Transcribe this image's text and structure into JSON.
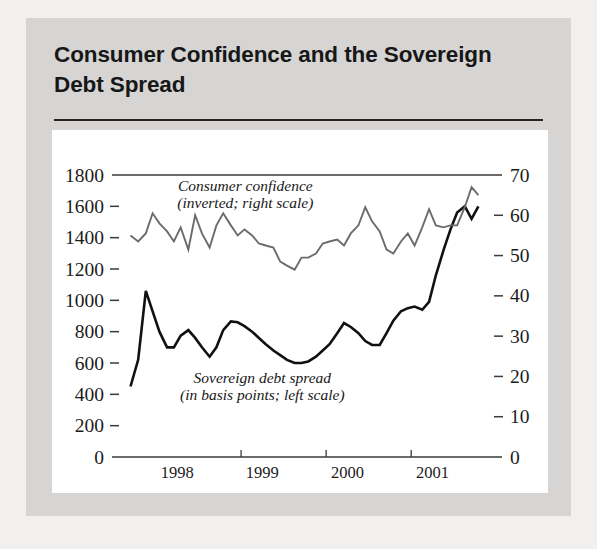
{
  "figure": {
    "title": "Consumer Confidence and the Sovereign Debt Spread",
    "title_line1": "Consumer Confidence and the Sovereign",
    "title_line2": "Debt Spread"
  },
  "colors": {
    "page_background": "#f1f0ef",
    "card_background": "#d6d5d4",
    "panel_background": "#ffffff",
    "spread_line": "#111111",
    "confidence_line": "#6b6b6b",
    "axis": "#3a3a3a",
    "text": "#1b1b1b"
  },
  "chart_data": {
    "type": "line",
    "title": "Consumer Confidence and the Sovereign Debt Spread",
    "xlabel": "",
    "ylabel": "",
    "grid": false,
    "legend_position": "inline-annotation",
    "x_axis": {
      "tick_labels": [
        "1998",
        "1999",
        "2000",
        "2001"
      ],
      "tick_positions": [
        1998.0,
        1999.0,
        2000.0,
        2001.0
      ],
      "xlim": [
        1997.6,
        2001.95
      ],
      "label_offsets": [
        1998.25,
        1999.25,
        2000.25,
        2001.25
      ]
    },
    "left_axis": {
      "name": "Sovereign debt spread (basis points)",
      "ticks": [
        0,
        200,
        400,
        600,
        800,
        1000,
        1200,
        1400,
        1600,
        1800
      ],
      "ylim": [
        0,
        1800
      ]
    },
    "right_axis": {
      "name": "Consumer confidence (inverted index)",
      "ticks": [
        0,
        10,
        20,
        30,
        40,
        50,
        60,
        70
      ],
      "ylim": [
        0,
        70
      ]
    },
    "annotations": [
      {
        "id": "confidence-annotation",
        "line1": "Consumer confidence",
        "line2": "(inverted; right scale)",
        "x": 1999.05,
        "y_right": 66.0
      },
      {
        "id": "spread-annotation",
        "line1": "Sovereign debt spread",
        "line2": "(in basis points; left scale)",
        "x": 1999.25,
        "y_left": 470
      }
    ],
    "series": [
      {
        "name": "Sovereign debt spread",
        "axis": "left",
        "units": "basis points",
        "color": "#111111",
        "x": [
          1997.7,
          1997.79,
          1997.88,
          1997.96,
          1998.04,
          1998.13,
          1998.21,
          1998.29,
          1998.38,
          1998.46,
          1998.54,
          1998.63,
          1998.71,
          1998.79,
          1998.88,
          1998.96,
          1999.04,
          1999.13,
          1999.21,
          1999.29,
          1999.38,
          1999.46,
          1999.54,
          1999.63,
          1999.71,
          1999.79,
          1999.88,
          1999.96,
          2000.04,
          2000.13,
          2000.21,
          2000.29,
          2000.38,
          2000.46,
          2000.54,
          2000.63,
          2000.71,
          2000.79,
          2000.88,
          2000.96,
          2001.04,
          2001.13,
          2001.21,
          2001.29,
          2001.38,
          2001.46,
          2001.54,
          2001.63,
          2001.71,
          2001.79
        ],
        "values": [
          450,
          620,
          1060,
          930,
          800,
          700,
          700,
          775,
          810,
          760,
          700,
          640,
          700,
          810,
          865,
          860,
          835,
          800,
          760,
          720,
          680,
          650,
          620,
          600,
          600,
          610,
          640,
          680,
          720,
          790,
          855,
          830,
          790,
          740,
          715,
          715,
          790,
          870,
          930,
          950,
          960,
          940,
          990,
          1160,
          1320,
          1450,
          1560,
          1600,
          1520,
          1600
        ]
      },
      {
        "name": "Consumer confidence",
        "axis": "right",
        "units": "index (inverted)",
        "color": "#6b6b6b",
        "x": [
          1997.7,
          1997.79,
          1997.88,
          1997.96,
          1998.04,
          1998.13,
          1998.21,
          1998.29,
          1998.38,
          1998.46,
          1998.54,
          1998.63,
          1998.71,
          1998.79,
          1998.88,
          1998.96,
          1999.04,
          1999.13,
          1999.21,
          1999.29,
          1999.38,
          1999.46,
          1999.54,
          1999.63,
          1999.71,
          1999.79,
          1999.88,
          1999.96,
          2000.04,
          2000.13,
          2000.21,
          2000.29,
          2000.38,
          2000.46,
          2000.54,
          2000.63,
          2000.71,
          2000.79,
          2000.88,
          2000.96,
          2001.04,
          2001.13,
          2001.21,
          2001.29,
          2001.38,
          2001.46,
          2001.54,
          2001.63,
          2001.71,
          2001.79
        ],
        "values": [
          55.0,
          53.5,
          55.5,
          60.5,
          58.0,
          56.0,
          53.5,
          57.0,
          51.5,
          60.0,
          55.5,
          52.0,
          57.5,
          60.5,
          57.5,
          55.0,
          56.5,
          55.0,
          53.0,
          52.5,
          52.0,
          48.5,
          47.5,
          46.5,
          49.5,
          49.5,
          50.5,
          53.0,
          53.5,
          54.0,
          52.5,
          55.5,
          57.5,
          62.0,
          58.5,
          56.0,
          51.5,
          50.5,
          53.5,
          55.5,
          52.5,
          57.0,
          61.5,
          57.5,
          57.0,
          57.5,
          57.5,
          62.0,
          67.0,
          65.0
        ]
      }
    ]
  }
}
